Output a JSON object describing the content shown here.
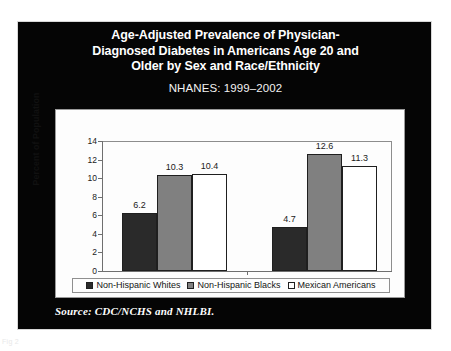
{
  "slide": {
    "title_lines": [
      "Age-Adjusted Prevalence of Physician-",
      "Diagnosed Diabetes in Americans Age 20 and",
      "Older by Sex and Race/Ethnicity"
    ],
    "subtitle": "NHANES: 1999–2002",
    "source": "Source: CDC/NCHS and NHLBI.",
    "page_caption": "Fig 2"
  },
  "chart_data": {
    "type": "bar",
    "subtitle": "NHANES: 1999–2002",
    "xlabel": "",
    "ylabel": "Percent of Population",
    "ylim": [
      0,
      14
    ],
    "yticks": [
      0,
      2,
      4,
      6,
      8,
      10,
      12,
      14
    ],
    "ytick_labels": [
      "0",
      "2",
      "4",
      "6",
      "8",
      "10",
      "12",
      "14"
    ],
    "categories": [
      "Men",
      "Women"
    ],
    "grid": false,
    "legend_position": "bottom",
    "series": [
      {
        "name": "Non-Hispanic Whites",
        "color": "#2a2a2a",
        "values": [
          6.2,
          4.7
        ],
        "value_labels": [
          "6.2",
          "4.7"
        ]
      },
      {
        "name": "Non-Hispanic Blacks",
        "color": "#808080",
        "values": [
          10.3,
          12.6
        ],
        "value_labels": [
          "10.3",
          "12.6"
        ]
      },
      {
        "name": "Mexican Americans",
        "color": "#ffffff",
        "values": [
          10.4,
          11.3
        ],
        "value_labels": [
          "10.4",
          "11.3"
        ]
      }
    ]
  }
}
